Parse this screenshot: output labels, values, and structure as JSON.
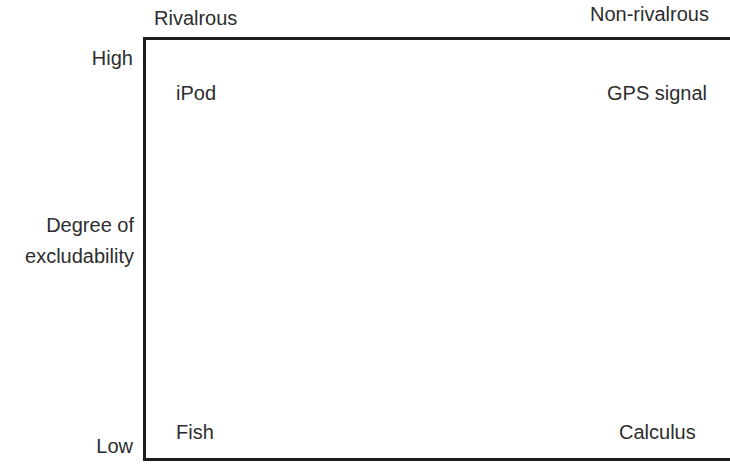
{
  "figure": {
    "width": 730,
    "height": 464,
    "background_color": "#ffffff",
    "line_color": "#1c1c1c",
    "text_color": "#2d2d2d"
  },
  "axes": {
    "x": {
      "title": "",
      "categories": [
        "Rivalrous",
        "Non-rivalrous"
      ]
    },
    "y": {
      "title_line1": "Degree of",
      "title_line2": "excludability",
      "high_label": "High",
      "low_label": "Low",
      "categories": [
        "High",
        "Low"
      ]
    }
  },
  "cells": {
    "high_rivalrous": "iPod",
    "high_nonrivalrous": "GPS signal",
    "low_rivalrous": "Fish",
    "low_nonrivalrous": "Calculus"
  },
  "chart_data": {
    "type": "table",
    "title": "",
    "xlabel": "",
    "ylabel": "Degree of excludability",
    "column_headers": [
      "Rivalrous",
      "Non-rivalrous"
    ],
    "row_headers": [
      "High",
      "Low"
    ],
    "rows": [
      {
        "row": "High",
        "values": [
          "iPod",
          "GPS signal"
        ]
      },
      {
        "row": "Low",
        "values": [
          "Fish",
          "Calculus"
        ]
      }
    ],
    "grid": false,
    "legend": "none",
    "annotations": []
  }
}
